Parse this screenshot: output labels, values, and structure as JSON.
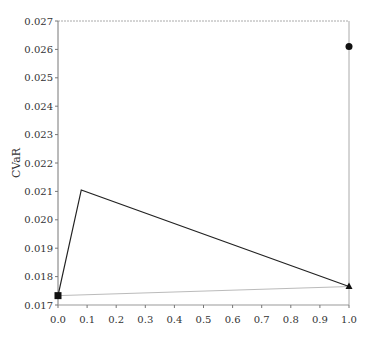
{
  "chart_data": {
    "type": "line",
    "title": "",
    "xlabel": "",
    "ylabel": "CVaR",
    "xlim": [
      0.0,
      1.0
    ],
    "ylim": [
      0.017,
      0.027
    ],
    "grid": false,
    "legend": null,
    "x_ticks": [
      "0.0",
      "0.1",
      "0.2",
      "0.3",
      "0.4",
      "0.5",
      "0.6",
      "0.7",
      "0.8",
      "0.9",
      "1.0"
    ],
    "y_ticks": [
      "0.017",
      "0.018",
      "0.019",
      "0.020",
      "0.021",
      "0.022",
      "0.023",
      "0.024",
      "0.025",
      "0.026",
      "0.027"
    ],
    "series": [
      {
        "name": "frontier",
        "style": "dark solid line",
        "color": "#222222",
        "points": [
          [
            0.0,
            0.01733
          ],
          [
            0.08,
            0.02105
          ],
          [
            1.0,
            0.01765
          ]
        ]
      },
      {
        "name": "reference line",
        "style": "light gray line",
        "color": "#bbbbbb",
        "points": [
          [
            0.0,
            0.01733
          ],
          [
            1.0,
            0.01765
          ]
        ]
      },
      {
        "name": "square marker",
        "marker": "square",
        "color": "#111111",
        "points": [
          [
            0.0,
            0.01733
          ]
        ]
      },
      {
        "name": "triangle marker",
        "marker": "triangle",
        "color": "#111111",
        "points": [
          [
            1.0,
            0.01765
          ]
        ]
      },
      {
        "name": "circle marker",
        "marker": "circle",
        "color": "#111111",
        "points": [
          [
            1.0,
            0.0261
          ]
        ]
      }
    ]
  }
}
